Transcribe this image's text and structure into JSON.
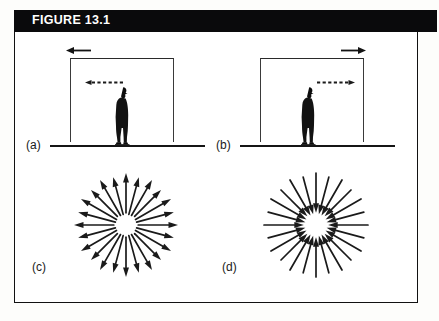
{
  "figure": {
    "header_label": "FIGURE 13.1",
    "frame_color": "#111111",
    "header_bg": "#0a0a0c",
    "header_text_color": "#ffffff",
    "background": "#ffffff"
  },
  "panels": [
    {
      "id": "a",
      "label": "(a)",
      "type": "elevator-scene",
      "description": "Man standing inside an open-bottom box (elevator cab) on a ground line; the cab accelerates to the left",
      "top_arrow": {
        "name": "acceleration-arrow",
        "direction": "left",
        "style": "solid"
      },
      "head_arrow": {
        "name": "light-beam-arrow",
        "direction": "left",
        "style": "dashed"
      },
      "ground_line": true,
      "figure_person": "man-silhouette"
    },
    {
      "id": "b",
      "label": "(b)",
      "type": "elevator-scene",
      "description": "Man standing inside an open-bottom box (elevator cab) on a ground line; the cab accelerates to the right",
      "top_arrow": {
        "name": "acceleration-arrow",
        "direction": "right",
        "style": "solid"
      },
      "head_arrow": {
        "name": "light-beam-arrow",
        "direction": "right",
        "style": "dashed"
      },
      "ground_line": true,
      "figure_person": "man-silhouette"
    },
    {
      "id": "c",
      "label": "(c)",
      "type": "radial-field",
      "description": "Radial field of arrows pointing outward from a central point (diverging / source)",
      "arrow_direction": "outward",
      "arrow_count": 24,
      "arrow_color": "#1a1a1a"
    },
    {
      "id": "d",
      "label": "(d)",
      "type": "radial-field",
      "description": "Radial field of arrows pointing inward toward a central point (converging / sink)",
      "arrow_direction": "inward",
      "arrow_count": 24,
      "arrow_color": "#1a1a1a"
    }
  ]
}
